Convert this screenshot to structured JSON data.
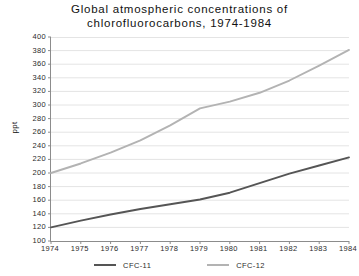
{
  "chart_data": {
    "type": "line",
    "title": "Global atmospheric concentrations of\nchlorofluorocarbons, 1974-1984",
    "xlabel": "",
    "ylabel": "ppt",
    "x": [
      1974,
      1975,
      1976,
      1977,
      1978,
      1979,
      1980,
      1981,
      1982,
      1983,
      1984
    ],
    "categories": [
      "1974",
      "1975",
      "1976",
      "1977",
      "1978",
      "1979",
      "1980",
      "1981",
      "1982",
      "1983",
      "1984"
    ],
    "series": [
      {
        "name": "CFC-11",
        "color": "#555555",
        "values": [
          120,
          130,
          139,
          147,
          154,
          161,
          171,
          185,
          199,
          211,
          223
        ]
      },
      {
        "name": "CFC-12",
        "color": "#b3b3b3",
        "values": [
          200,
          214,
          230,
          248,
          270,
          295,
          305,
          318,
          336,
          358,
          381
        ]
      }
    ],
    "ylim": [
      100,
      400
    ],
    "ytick_step": 20,
    "yticks": [
      400,
      380,
      360,
      340,
      320,
      300,
      280,
      260,
      240,
      220,
      200,
      180,
      160,
      140,
      120,
      100
    ],
    "xlim": [
      1974,
      1984
    ],
    "grid": true,
    "grid_color": "#e4e4e4",
    "axis_color": "#8c8c8c",
    "legend_position": "bottom",
    "background": "#ffffff"
  }
}
